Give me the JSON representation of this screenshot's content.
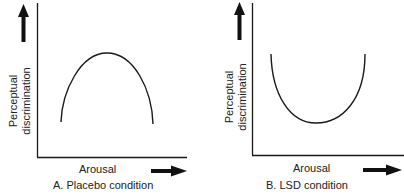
{
  "panels": [
    {
      "id": "A",
      "caption": "A. Placebo condition",
      "xlabel": "Arousal",
      "ylabel_line1": "Perceptual",
      "ylabel_line2": "discrimination",
      "curve": "inverted-U"
    },
    {
      "id": "B",
      "caption": "B. LSD condition",
      "xlabel": "Arousal",
      "ylabel_line1": "Perceptual",
      "ylabel_line2": "discrimination",
      "curve": "U"
    }
  ],
  "colors": {
    "ink": "#1a1a1a",
    "background": "#ffffff"
  }
}
